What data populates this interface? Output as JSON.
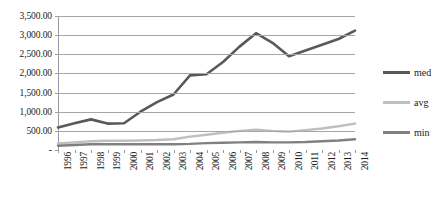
{
  "chart_data": {
    "type": "line",
    "title": "",
    "xlabel": "",
    "ylabel": "",
    "ylim": [
      0,
      3500
    ],
    "ytick_labels": [
      "3,500.00",
      "3,000.00",
      "2,500.00",
      "2,000.00",
      "1,500.00",
      "1,000.00",
      "500.00",
      "-"
    ],
    "ytick_values": [
      3500,
      3000,
      2500,
      2000,
      1500,
      1000,
      500,
      0
    ],
    "grid": true,
    "legend_position": "right",
    "categories": [
      "1996",
      "1997",
      "1998",
      "1999",
      "2000",
      "2001",
      "2002",
      "2003",
      "2004",
      "2005",
      "2006",
      "2007",
      "2008",
      "2009",
      "2010",
      "2011",
      "2012",
      "2013",
      "2014"
    ],
    "series": [
      {
        "name": "med",
        "color": "#595959",
        "values": [
          590,
          700,
          800,
          690,
          700,
          1000,
          1250,
          1450,
          1950,
          1980,
          2300,
          2700,
          3050,
          2800,
          2450,
          2600,
          2750,
          2900,
          3120
        ]
      },
      {
        "name": "avg",
        "color": "#bfbfbf",
        "values": [
          170,
          200,
          230,
          240,
          240,
          250,
          260,
          280,
          350,
          400,
          450,
          500,
          530,
          500,
          480,
          520,
          560,
          620,
          690
        ]
      },
      {
        "name": "min",
        "color": "#808080",
        "values": [
          110,
          130,
          150,
          150,
          150,
          150,
          150,
          150,
          160,
          180,
          190,
          200,
          210,
          200,
          200,
          210,
          230,
          250,
          280
        ]
      }
    ]
  },
  "legend": {
    "items": [
      {
        "label": "med",
        "color": "#595959"
      },
      {
        "label": "avg",
        "color": "#bfbfbf"
      },
      {
        "label": "min",
        "color": "#808080"
      }
    ]
  }
}
